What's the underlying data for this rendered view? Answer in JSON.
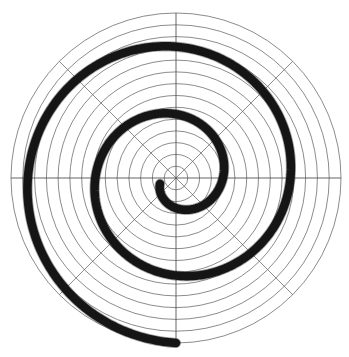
{
  "chart_data": {
    "type": "line",
    "plot_style": "polar",
    "title": "",
    "subtitle": "",
    "xlabel": "",
    "ylabel": "",
    "grid": true,
    "legend": null,
    "legend_position": "none",
    "annotations": [],
    "tick_labels": {
      "radial": [],
      "angular": []
    },
    "polar_axes": {
      "center_px": [
        176,
        178
      ],
      "max_radius_px": 165,
      "radial_gridline_count": 14,
      "radial_gridline_radii_px": [
        11.8,
        23.6,
        35.4,
        47.1,
        58.9,
        70.7,
        82.5,
        94.3,
        106.1,
        117.9,
        129.6,
        141.4,
        153.2,
        165.0
      ],
      "angular_gridline_count": 8,
      "angular_gridline_degrees": [
        0,
        45,
        90,
        135,
        180,
        225,
        270,
        315
      ],
      "axis_lines_degrees": [
        0,
        90,
        180,
        270
      ],
      "grid_color": "#5a5a5a",
      "axis_color": "#4a4a4a",
      "rlim": [
        0,
        165
      ],
      "theta_direction": "counterclockwise",
      "theta_zero_location": "East"
    },
    "series": [
      {
        "name": "spiral",
        "kind": "archimedean_spiral",
        "color": "#151515",
        "line_width_px": 8.5,
        "turns": 2.5,
        "theta_start_deg": 200,
        "theta_end_deg": 990,
        "r_start_px": 17,
        "r_end_px": 165,
        "start_point_px": [
          160,
          184
        ],
        "end_point_px": [
          176,
          13
        ],
        "r_of_theta": "r = 17 + 148 * (theta - 200) / 790  (theta in degrees)",
        "points_polar_deg_px": [
          [
            200,
            17.0
          ],
          [
            230,
            22.6
          ],
          [
            260,
            28.2
          ],
          [
            290,
            33.8
          ],
          [
            320,
            39.5
          ],
          [
            350,
            45.1
          ],
          [
            380,
            50.7
          ],
          [
            410,
            56.3
          ],
          [
            440,
            61.9
          ],
          [
            470,
            67.6
          ],
          [
            500,
            73.2
          ],
          [
            530,
            78.8
          ],
          [
            560,
            84.4
          ],
          [
            590,
            90.1
          ],
          [
            620,
            95.7
          ],
          [
            650,
            101.3
          ],
          [
            680,
            106.9
          ],
          [
            710,
            112.5
          ],
          [
            740,
            118.2
          ],
          [
            770,
            123.8
          ],
          [
            800,
            129.4
          ],
          [
            830,
            135.0
          ],
          [
            860,
            140.6
          ],
          [
            890,
            146.3
          ],
          [
            920,
            151.9
          ],
          [
            950,
            157.5
          ],
          [
            980,
            163.1
          ],
          [
            990,
            165.0
          ]
        ]
      }
    ]
  },
  "figure": {
    "background_color": "#ffffff",
    "width_px": 349,
    "height_px": 357
  }
}
